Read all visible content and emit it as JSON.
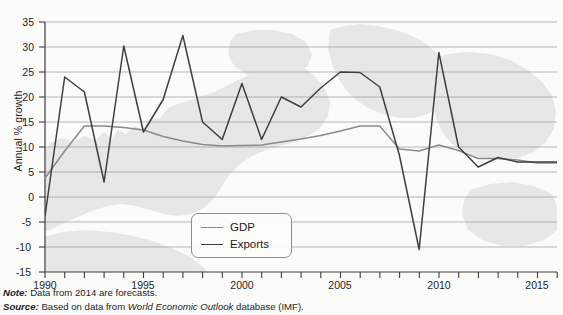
{
  "axes": {
    "ylabel": "Annual % growth",
    "yticks": [
      "35",
      "30",
      "25",
      "20",
      "15",
      "10",
      "5",
      "0",
      "-5",
      "-10",
      "-15"
    ],
    "xticks": [
      "1990",
      "1995",
      "2000",
      "2005",
      "2010",
      "2015"
    ]
  },
  "legend": {
    "items": [
      {
        "label": "GDP",
        "color": "#8a8a8a"
      },
      {
        "label": "Exports",
        "color": "#3f3f3f"
      }
    ]
  },
  "footnotes": {
    "note_lead": "Note:",
    "note_text": " Data from 2014 are forecasts.",
    "source_lead": "Source:",
    "source_text_a": " Based on data from ",
    "source_italic": "World Economic Outlook",
    "source_text_b": " database (IMF)."
  },
  "chart_data": {
    "type": "line",
    "title": "",
    "xlabel": "",
    "ylabel": "Annual % growth",
    "xlim": [
      1990,
      2016
    ],
    "ylim": [
      -15,
      35
    ],
    "grid": true,
    "legend_position": "inside-bottom-center",
    "x": [
      1990,
      1991,
      1992,
      1993,
      1994,
      1995,
      1996,
      1997,
      1998,
      1999,
      2000,
      2001,
      2002,
      2003,
      2004,
      2005,
      2006,
      2007,
      2008,
      2009,
      2010,
      2011,
      2012,
      2013,
      2014,
      2015,
      2016
    ],
    "series": [
      {
        "name": "GDP",
        "color": "#8a8a8a",
        "values": [
          3.8,
          9.2,
          14.2,
          14.2,
          13.9,
          13.4,
          12.1,
          11.2,
          10.5,
          10.2,
          10.3,
          10.4,
          11.0,
          11.6,
          12.3,
          13.2,
          14.2,
          14.2,
          9.6,
          9.2,
          10.4,
          9.3,
          7.7,
          7.7,
          7.4,
          6.8,
          6.8
        ],
        "style": "solid"
      },
      {
        "name": "Exports",
        "color": "#3f3f3f",
        "values": [
          -3.8,
          24.0,
          21.0,
          3.0,
          30.2,
          13.0,
          19.5,
          32.3,
          15.0,
          11.5,
          22.7,
          11.5,
          20.0,
          18.0,
          21.8,
          25.0,
          24.9,
          22.0,
          8.3,
          -10.5,
          28.9,
          10.0,
          6.0,
          7.9,
          7.0,
          7.0,
          7.0
        ],
        "style": "solid"
      }
    ]
  },
  "background": {
    "map_silhouette": true,
    "map_color": "#e6e6e4"
  }
}
